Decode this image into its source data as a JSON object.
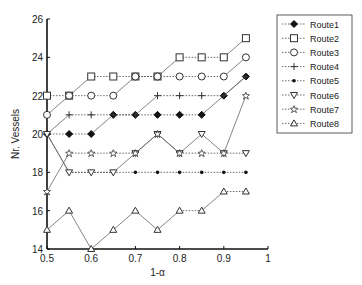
{
  "chart_data": {
    "type": "line",
    "title": "",
    "xlabel": "1-α",
    "ylabel": "Nr. Vessels",
    "xlim": [
      0.5,
      1
    ],
    "ylim": [
      14,
      26
    ],
    "x_ticks": [
      "0.5",
      "0.6",
      "0.7",
      "0.8",
      "0.9",
      "1"
    ],
    "y_ticks": [
      "14",
      "16",
      "18",
      "20",
      "22",
      "24",
      "26"
    ],
    "x": [
      0.5,
      0.55,
      0.6,
      0.65,
      0.7,
      0.75,
      0.8,
      0.85,
      0.9,
      0.95
    ],
    "legend_position": "right",
    "grid": false,
    "series": [
      {
        "name": "Route1",
        "marker": "diamond-filled",
        "values": [
          20,
          20,
          20,
          21,
          21,
          21,
          21,
          21,
          22,
          23
        ]
      },
      {
        "name": "Route2",
        "marker": "square",
        "values": [
          22,
          22,
          23,
          23,
          23,
          23,
          24,
          24,
          24,
          25
        ]
      },
      {
        "name": "Route3",
        "marker": "circle",
        "values": [
          21,
          22,
          22,
          22,
          23,
          23,
          23,
          23,
          23,
          24
        ]
      },
      {
        "name": "Route4",
        "marker": "plus",
        "values": [
          20,
          21,
          21,
          21,
          21,
          22,
          22,
          22,
          22,
          23
        ]
      },
      {
        "name": "Route5",
        "marker": "dot",
        "values": [
          20,
          18,
          18,
          18,
          18,
          18,
          18,
          18,
          18,
          18
        ]
      },
      {
        "name": "Route6",
        "marker": "triangle-down",
        "values": [
          20,
          18,
          18,
          18,
          19,
          20,
          19,
          20,
          19,
          19
        ]
      },
      {
        "name": "Route7",
        "marker": "star",
        "values": [
          17,
          19,
          19,
          19,
          19,
          20,
          19,
          19,
          19,
          22
        ]
      },
      {
        "name": "Route8",
        "marker": "triangle-up",
        "values": [
          15,
          16,
          14,
          15,
          16,
          15,
          16,
          16,
          17,
          17
        ]
      }
    ]
  }
}
